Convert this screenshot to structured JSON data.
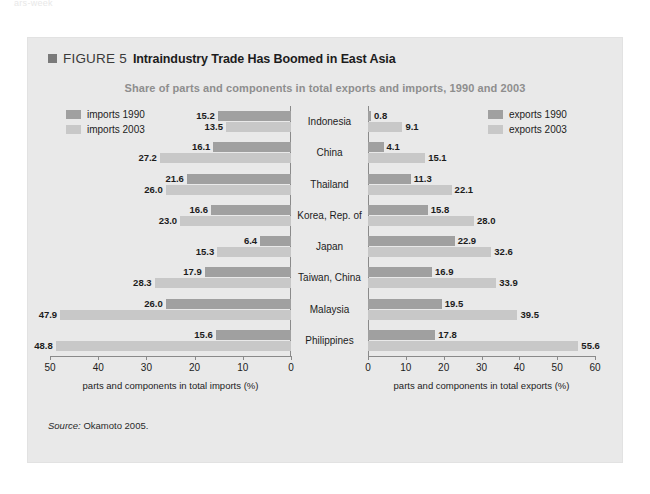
{
  "ghost_text": "ars-week",
  "figure": {
    "label": "FIGURE 5",
    "title": "Intraindustry Trade Has Boomed in East Asia",
    "subtitle": "Share of parts and components in total exports and imports, 1990 and 2003",
    "source_word": "Source:",
    "source_body": " Okamoto 2005."
  },
  "colors": {
    "panel_bg": "#e9e9e9",
    "series_1990": "#a0a0a0",
    "series_2003": "#c8c8c8",
    "axis": "#8a8a8a",
    "subtitle": "#8e8e8e",
    "text": "#1c1c1c"
  },
  "legends": {
    "imports": [
      {
        "label": "imports 1990",
        "color": "#a0a0a0"
      },
      {
        "label": "imports 2003",
        "color": "#c8c8c8"
      }
    ],
    "exports": [
      {
        "label": "exports 1990",
        "color": "#a0a0a0"
      },
      {
        "label": "exports 2003",
        "color": "#c8c8c8"
      }
    ]
  },
  "chart_data": {
    "type": "bar",
    "title": "Intraindustry Trade Has Boomed in East Asia",
    "subtitle": "Share of parts and components in total exports and imports, 1990 and 2003",
    "orientation": "horizontal",
    "grid": false,
    "legend_position": "top-left and top-right",
    "panels": [
      {
        "name": "imports",
        "xlabel": "parts and components in total imports (%)",
        "direction": "rtl",
        "xlim": [
          0,
          50
        ],
        "ticks": [
          50,
          40,
          30,
          20,
          10,
          0
        ],
        "categories": [
          "Indonesia",
          "China",
          "Thailand",
          "Korea, Rep. of",
          "Japan",
          "Taiwan, China",
          "Malaysia",
          "Philippines"
        ],
        "series": [
          {
            "name": "imports 1990",
            "color": "#a0a0a0",
            "values": [
              15.2,
              16.1,
              21.6,
              16.6,
              6.4,
              17.9,
              26.0,
              15.6
            ]
          },
          {
            "name": "imports 2003",
            "color": "#c8c8c8",
            "values": [
              13.5,
              27.2,
              26.0,
              23.0,
              15.3,
              28.3,
              47.9,
              48.8
            ]
          }
        ]
      },
      {
        "name": "exports",
        "xlabel": "parts and components in total exports (%)",
        "direction": "ltr",
        "xlim": [
          0,
          60
        ],
        "ticks": [
          0,
          10,
          20,
          30,
          40,
          50,
          60
        ],
        "categories": [
          "Indonesia",
          "China",
          "Thailand",
          "Korea, Rep. of",
          "Japan",
          "Taiwan, China",
          "Malaysia",
          "Philippines"
        ],
        "series": [
          {
            "name": "exports 1990",
            "color": "#a0a0a0",
            "values": [
              0.8,
              4.1,
              11.3,
              15.8,
              22.9,
              16.9,
              19.5,
              17.8
            ]
          },
          {
            "name": "exports 2003",
            "color": "#c8c8c8",
            "values": [
              9.1,
              15.1,
              22.1,
              28.0,
              32.6,
              33.9,
              39.5,
              55.6
            ]
          }
        ]
      }
    ]
  }
}
